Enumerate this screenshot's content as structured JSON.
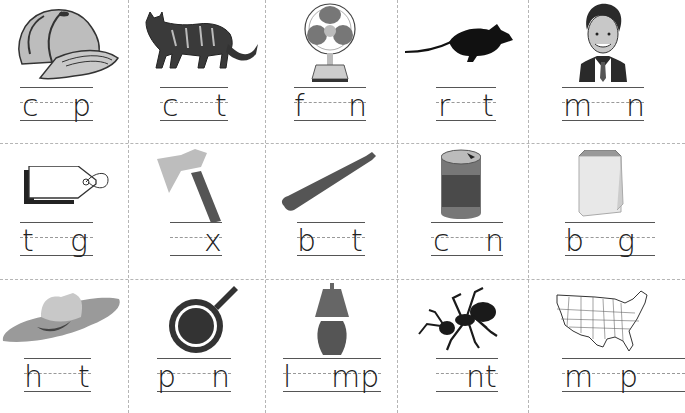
{
  "worksheet": {
    "title": "Short vowel CVC words - write the missing vowel",
    "rows": [
      [
        {
          "picture": "cap-icon",
          "word": "cap",
          "first": "c",
          "last": "p"
        },
        {
          "picture": "cat-icon",
          "word": "cat",
          "first": "c",
          "last": "t"
        },
        {
          "picture": "fan-icon",
          "word": "fan",
          "first": "f",
          "last": "n"
        },
        {
          "picture": "rat-icon",
          "word": "rat",
          "first": "r",
          "last": "t"
        },
        {
          "picture": "man-icon",
          "word": "man",
          "first": "m",
          "last": "n"
        }
      ],
      [
        {
          "picture": "tag-icon",
          "word": "tag",
          "first": "t",
          "last": "g"
        },
        {
          "picture": "ax-icon",
          "word": "ax",
          "first": "",
          "last": "x"
        },
        {
          "picture": "bat-icon",
          "word": "bat",
          "first": "b",
          "last": "t"
        },
        {
          "picture": "can-icon",
          "word": "can",
          "first": "c",
          "last": "n"
        },
        {
          "picture": "bag-icon",
          "word": "bag",
          "first": "b",
          "last": "g"
        }
      ],
      [
        {
          "picture": "hat-icon",
          "word": "hat",
          "first": "h",
          "last": "t"
        },
        {
          "picture": "pan-icon",
          "word": "pan",
          "first": "p",
          "last": "n"
        },
        {
          "picture": "lamp-icon",
          "word": "lamp",
          "first": "l",
          "last": "mp"
        },
        {
          "picture": "ant-icon",
          "word": "ant",
          "first": "",
          "last": "nt"
        },
        {
          "picture": "map-icon",
          "word": "map",
          "first": "m",
          "last": "p"
        }
      ]
    ],
    "colors": {
      "line": "#555555",
      "dashed": "#999999",
      "divider": "#b5b5b5",
      "ink": "#222222"
    }
  }
}
